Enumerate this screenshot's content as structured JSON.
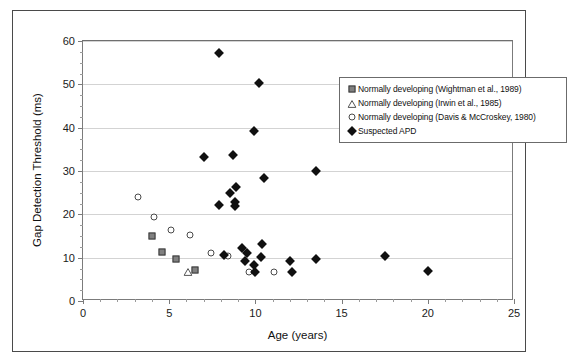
{
  "chart_data": {
    "type": "scatter",
    "title": "",
    "xlabel": "Age (years)",
    "ylabel": "Gap Detection Threshold (ms)",
    "xlim": [
      0,
      25
    ],
    "ylim": [
      0,
      60
    ],
    "x_ticks": [
      0,
      5,
      10,
      15,
      20,
      25
    ],
    "y_ticks": [
      0,
      10,
      20,
      30,
      40,
      50,
      60
    ],
    "x_minor_step": 1,
    "y_minor_step": 2.5,
    "grid": "horizontal",
    "legend_position": "top-right",
    "series": [
      {
        "name": "Normally developing (Wightman et al., 1989)",
        "marker": "filled-square",
        "color": "#808080",
        "points": [
          {
            "x": 4.0,
            "y": 15.0
          },
          {
            "x": 4.6,
            "y": 11.3
          },
          {
            "x": 5.4,
            "y": 9.7
          },
          {
            "x": 6.5,
            "y": 7.2
          }
        ]
      },
      {
        "name": "Normally developing (Irwin et al., 1985)",
        "marker": "open-triangle",
        "color": "#555555",
        "points": [
          {
            "x": 6.1,
            "y": 7.0
          }
        ]
      },
      {
        "name": "Normally developing (Davis & McCroskey, 1980)",
        "marker": "open-circle",
        "color": "#4a4a4a",
        "points": [
          {
            "x": 3.2,
            "y": 24.0
          },
          {
            "x": 4.1,
            "y": 19.3
          },
          {
            "x": 5.1,
            "y": 16.3
          },
          {
            "x": 6.2,
            "y": 15.2
          },
          {
            "x": 7.4,
            "y": 11.0
          },
          {
            "x": 8.4,
            "y": 10.4
          },
          {
            "x": 9.6,
            "y": 6.8
          },
          {
            "x": 11.1,
            "y": 6.8
          }
        ]
      },
      {
        "name": "Suspected APD",
        "marker": "filled-diamond",
        "color": "#101010",
        "points": [
          {
            "x": 7.9,
            "y": 57.2
          },
          {
            "x": 10.2,
            "y": 50.2
          },
          {
            "x": 9.9,
            "y": 39.3
          },
          {
            "x": 7.0,
            "y": 33.2
          },
          {
            "x": 8.7,
            "y": 33.8
          },
          {
            "x": 10.5,
            "y": 28.5
          },
          {
            "x": 13.5,
            "y": 30.0
          },
          {
            "x": 8.5,
            "y": 25.0
          },
          {
            "x": 8.9,
            "y": 26.3
          },
          {
            "x": 7.9,
            "y": 22.2
          },
          {
            "x": 8.8,
            "y": 22.0
          },
          {
            "x": 8.8,
            "y": 22.8
          },
          {
            "x": 8.2,
            "y": 10.7
          },
          {
            "x": 9.2,
            "y": 12.3
          },
          {
            "x": 9.5,
            "y": 11.1
          },
          {
            "x": 9.4,
            "y": 9.3
          },
          {
            "x": 9.9,
            "y": 8.3
          },
          {
            "x": 10.0,
            "y": 6.8
          },
          {
            "x": 10.3,
            "y": 10.1
          },
          {
            "x": 10.4,
            "y": 13.2
          },
          {
            "x": 12.0,
            "y": 9.3
          },
          {
            "x": 12.1,
            "y": 6.7
          },
          {
            "x": 13.5,
            "y": 9.6
          },
          {
            "x": 17.5,
            "y": 10.4
          },
          {
            "x": 20.0,
            "y": 7.0
          }
        ]
      }
    ],
    "legend_entries": [
      "Normally developing (Wightman et al., 1989)",
      "Normally developing (Irwin et al., 1985)",
      "Normally developing (Davis & McCroskey, 1980)",
      "Suspected APD"
    ]
  }
}
